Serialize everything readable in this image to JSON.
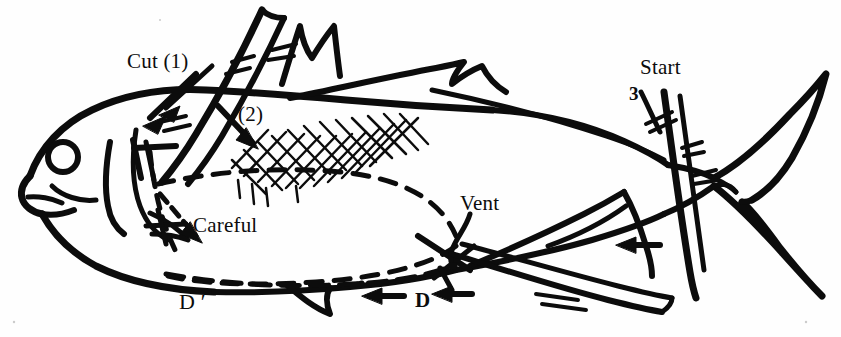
{
  "figure": {
    "background_color": "#ffffff",
    "ink_color": "#0c0c0c"
  },
  "labels": [
    {
      "id": "cut1",
      "text": "Cut (1)",
      "x": 127,
      "y": 51,
      "name": "label-cut-1"
    },
    {
      "id": "step2",
      "text": "(2)",
      "x": 238,
      "y": 104,
      "name": "label-step-2"
    },
    {
      "id": "careful",
      "text": "Careful",
      "x": 193,
      "y": 215,
      "name": "label-careful"
    },
    {
      "id": "dprime",
      "text": "D ′",
      "x": 179,
      "y": 291,
      "name": "label-d-prime"
    },
    {
      "id": "vent",
      "text": "Vent",
      "x": 460,
      "y": 193,
      "name": "label-vent"
    },
    {
      "id": "d",
      "text": "D",
      "x": 415,
      "y": 290,
      "name": "label-d"
    },
    {
      "id": "start",
      "text": "Start",
      "x": 640,
      "y": 57,
      "name": "label-start"
    },
    {
      "id": "three",
      "text": "3",
      "x": 629,
      "y": 84,
      "name": "label-step-3"
    }
  ],
  "annotations": {
    "cut_1_note": "Arrow from 'Cut (1)' pointing down-left to the gill/collar cut",
    "cut_2_note": "Arrow from '(2)' pointing down-right into the cross-hatched body area",
    "careful_note": "Dashed arrow pointing down-right to the delicate belly area",
    "vent_note": "Curved leader line from 'Vent' down to the vent point",
    "d_note": "Two left-pointing arrows beside the letter D along the belly",
    "start_note": "Vertical cut line at the tail, labelled Start, step 3",
    "belly_outline": "Long dashed oval indicating the body cavity from head to vent",
    "hatching": "Cross-hatched diamond pattern over the mid-upper body"
  }
}
